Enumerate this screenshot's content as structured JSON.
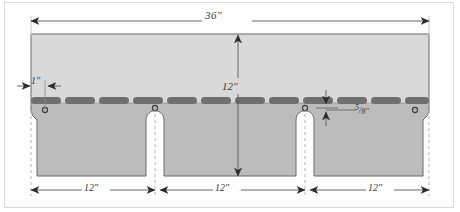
{
  "diagram": {
    "colors": {
      "upper_face": "#d9d9d9",
      "lower_face": "#bcbcbc",
      "adhesive_strip": "#6f6f6f",
      "outline": "#6b6b6b",
      "dimension_line": "#5a5a5a",
      "dashed_line": "#b5b5b5",
      "background": "#fdfdfd",
      "frame_border": "#d9d9d9"
    },
    "dimensions": {
      "overall_width": "36\"",
      "overall_height": "12\"",
      "top_offset": "1\"",
      "strip_offset_numerator": "5",
      "strip_offset_denominator": "8",
      "strip_offset_unit": "\"",
      "tab_width_1": "12\"",
      "tab_width_2": "12\"",
      "tab_width_3": "12\""
    },
    "features": {
      "adhesive_strip_count": 12,
      "nail_marker_count": 4,
      "tab_slot_count": 2,
      "edge_chamfer_count": 2
    }
  }
}
